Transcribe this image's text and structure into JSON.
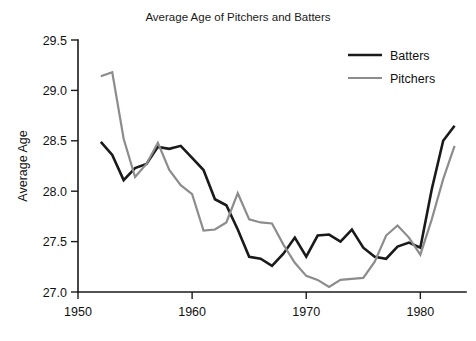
{
  "chart_data": {
    "type": "line",
    "title": "Average Age of Pitchers and Batters",
    "xlabel": "",
    "ylabel": "Average Age",
    "xlim": [
      1950,
      1984
    ],
    "ylim": [
      27.0,
      29.5
    ],
    "xticks": [
      "1950",
      "1960",
      "1970",
      "1980"
    ],
    "xtick_values": [
      1950,
      1960,
      1970,
      1980
    ],
    "yticks": [
      "27.0",
      "27.5",
      "28.0",
      "28.5",
      "29.0",
      "29.5"
    ],
    "ytick_values": [
      27.0,
      27.5,
      28.0,
      28.5,
      29.0,
      29.5
    ],
    "grid": false,
    "legend_position": "top-right",
    "x": [
      1952,
      1953,
      1954,
      1955,
      1956,
      1957,
      1958,
      1959,
      1960,
      1961,
      1962,
      1963,
      1964,
      1965,
      1966,
      1967,
      1968,
      1969,
      1970,
      1971,
      1972,
      1973,
      1974,
      1975,
      1976,
      1977,
      1978,
      1979,
      1980,
      1981,
      1982,
      1983
    ],
    "series": [
      {
        "name": "Batters",
        "color": "#1a1a1a",
        "width": 2.6,
        "values": [
          28.49,
          28.36,
          28.11,
          28.23,
          28.27,
          28.44,
          28.42,
          28.45,
          28.33,
          28.21,
          27.92,
          27.86,
          27.62,
          27.35,
          27.33,
          27.26,
          27.38,
          27.54,
          27.35,
          27.56,
          27.57,
          27.5,
          27.62,
          27.44,
          27.35,
          27.33,
          27.45,
          27.49,
          27.44,
          28.02,
          28.5,
          28.65
        ]
      },
      {
        "name": "Pitchers",
        "color": "#8c8c8c",
        "width": 2.2,
        "values": [
          29.14,
          29.18,
          28.52,
          28.14,
          28.27,
          28.48,
          28.21,
          28.06,
          27.97,
          27.61,
          27.62,
          27.69,
          27.98,
          27.72,
          27.69,
          27.68,
          27.47,
          27.29,
          27.16,
          27.12,
          27.05,
          27.12,
          27.13,
          27.14,
          27.3,
          27.56,
          27.66,
          27.54,
          27.37,
          27.72,
          28.12,
          28.45
        ]
      }
    ],
    "legend_entries": [
      "Batters",
      "Pitchers"
    ]
  },
  "legend": {
    "items": [
      {
        "label": "Batters"
      },
      {
        "label": "Pitchers"
      }
    ]
  }
}
